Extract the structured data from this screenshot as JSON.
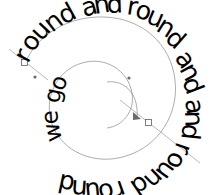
{
  "document": {
    "title": "round and round and round and round we go",
    "canvas": {
      "width": 213,
      "height": 195,
      "background_color": "#ffffff"
    }
  },
  "artwork": {
    "type": "text-on-path",
    "text_color": "#000000",
    "guide_color": "#8a8a8a",
    "node_stroke_color": "#5f5f5f",
    "node_fill_color": "#ffffff",
    "outer_text": "round and round and round and",
    "inner_text": "we go",
    "full_text": "round and round and round and we go"
  },
  "outer_glyphs": [
    {
      "char": "r",
      "x": 28,
      "y": 64,
      "rot": -62
    },
    {
      "char": "o",
      "x": 33,
      "y": 53,
      "rot": -56
    },
    {
      "char": "u",
      "x": 41,
      "y": 42,
      "rot": -47
    },
    {
      "char": "n",
      "x": 52,
      "y": 33,
      "rot": -38
    },
    {
      "char": "d",
      "x": 64,
      "y": 25,
      "rot": -29
    },
    {
      "char": " ",
      "x": 76,
      "y": 20,
      "rot": -22
    },
    {
      "char": "a",
      "x": 84,
      "y": 17,
      "rot": -16
    },
    {
      "char": "n",
      "x": 95,
      "y": 14,
      "rot": -9
    },
    {
      "char": "d",
      "x": 107,
      "y": 13,
      "rot": -2
    },
    {
      "char": " ",
      "x": 118,
      "y": 13,
      "rot": 4
    },
    {
      "char": "r",
      "x": 126,
      "y": 14,
      "rot": 9
    },
    {
      "char": "o",
      "x": 134,
      "y": 17,
      "rot": 15
    },
    {
      "char": "u",
      "x": 145,
      "y": 22,
      "rot": 23
    },
    {
      "char": "n",
      "x": 155,
      "y": 30,
      "rot": 32
    },
    {
      "char": "d",
      "x": 164,
      "y": 40,
      "rot": 41
    },
    {
      "char": " ",
      "x": 170,
      "y": 50,
      "rot": 48
    },
    {
      "char": "a",
      "x": 174,
      "y": 58,
      "rot": 54
    },
    {
      "char": "n",
      "x": 179,
      "y": 69,
      "rot": 61
    },
    {
      "char": "d",
      "x": 182,
      "y": 81,
      "rot": 69
    },
    {
      "char": " ",
      "x": 184,
      "y": 92,
      "rot": 76
    },
    {
      "char": "a",
      "x": 185,
      "y": 100,
      "rot": 81
    },
    {
      "char": "n",
      "x": 185,
      "y": 111,
      "rot": 88
    },
    {
      "char": "d",
      "x": 183,
      "y": 123,
      "rot": 96
    },
    {
      "char": " ",
      "x": 180,
      "y": 133,
      "rot": 103
    },
    {
      "char": "r",
      "x": 177,
      "y": 141,
      "rot": 109
    },
    {
      "char": "o",
      "x": 172,
      "y": 150,
      "rot": 116
    },
    {
      "char": "u",
      "x": 164,
      "y": 159,
      "rot": 126
    },
    {
      "char": "n",
      "x": 154,
      "y": 167,
      "rot": 136
    },
    {
      "char": "d",
      "x": 142,
      "y": 174,
      "rot": 146
    },
    {
      "char": " ",
      "x": 131,
      "y": 178,
      "rot": 154
    },
    {
      "char": "r",
      "x": 122,
      "y": 180,
      "rot": 160
    },
    {
      "char": "o",
      "x": 112,
      "y": 182,
      "rot": 167
    },
    {
      "char": "u",
      "x": 100,
      "y": 182,
      "rot": 175
    },
    {
      "char": "n",
      "x": 88,
      "y": 181,
      "rot": 184
    },
    {
      "char": "d",
      "x": 76,
      "y": 177,
      "rot": 192
    }
  ],
  "inner_glyphs": [
    {
      "char": "w",
      "x": 62,
      "y": 140,
      "rot": -102
    },
    {
      "char": "e",
      "x": 58,
      "y": 124,
      "rot": -93
    },
    {
      "char": " ",
      "x": 58,
      "y": 113,
      "rot": -86
    },
    {
      "char": "g",
      "x": 59,
      "y": 104,
      "rot": -79
    },
    {
      "char": "o",
      "x": 63,
      "y": 92,
      "rot": -69
    }
  ],
  "path_nodes": [
    {
      "name": "node-start-left",
      "x": 25,
      "y": 63,
      "shape": "square"
    },
    {
      "name": "node-end-right",
      "x": 149,
      "y": 123,
      "shape": "square"
    },
    {
      "name": "node-inner-upper",
      "x": 129,
      "y": 78,
      "shape": "dot"
    },
    {
      "name": "node-inner-lower",
      "x": 137,
      "y": 117,
      "shape": "arrow"
    },
    {
      "name": "node-handle-left",
      "x": 35,
      "y": 77,
      "shape": "dot"
    }
  ],
  "tangent_handles": [
    {
      "name": "tangent-handle-left",
      "x1": 9,
      "y1": 49,
      "x2": 48,
      "y2": 80
    },
    {
      "name": "tangent-handle-right",
      "x1": 120,
      "y1": 100,
      "x2": 200,
      "y2": 163
    }
  ]
}
